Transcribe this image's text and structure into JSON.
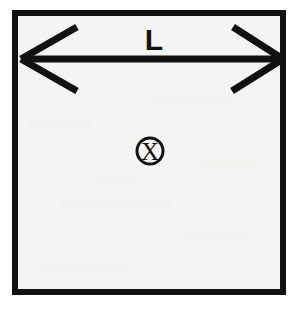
{
  "figure": {
    "type": "technical-diagram",
    "canvas": {
      "width": 304,
      "height": 313
    },
    "background_color": "#ffffff",
    "ink_color": "#111111"
  },
  "boundary": {
    "name": "square-outline",
    "shape": "square",
    "fill_color": "#f4f4f2",
    "stroke_color": "#111111",
    "stroke_width": 6,
    "x": 12,
    "y": 10,
    "width": 274,
    "height": 285
  },
  "dimension": {
    "name": "width-dimension",
    "label": "L",
    "arrow_style": "double-headed",
    "orientation": "horizontal",
    "shaft_y": 59,
    "left_tip_x": 21,
    "right_tip_x": 283,
    "stroke_width": 7,
    "label_x": 154,
    "label_y": 50
  },
  "symbol": {
    "name": "field-into-page-symbol",
    "glyph": "X",
    "meaning": "vector into the page",
    "center_x": 150,
    "center_y": 151,
    "radius": 13,
    "stroke_width": 3
  },
  "legend": {
    "dimension_name": "L",
    "symbol_name": "X"
  }
}
